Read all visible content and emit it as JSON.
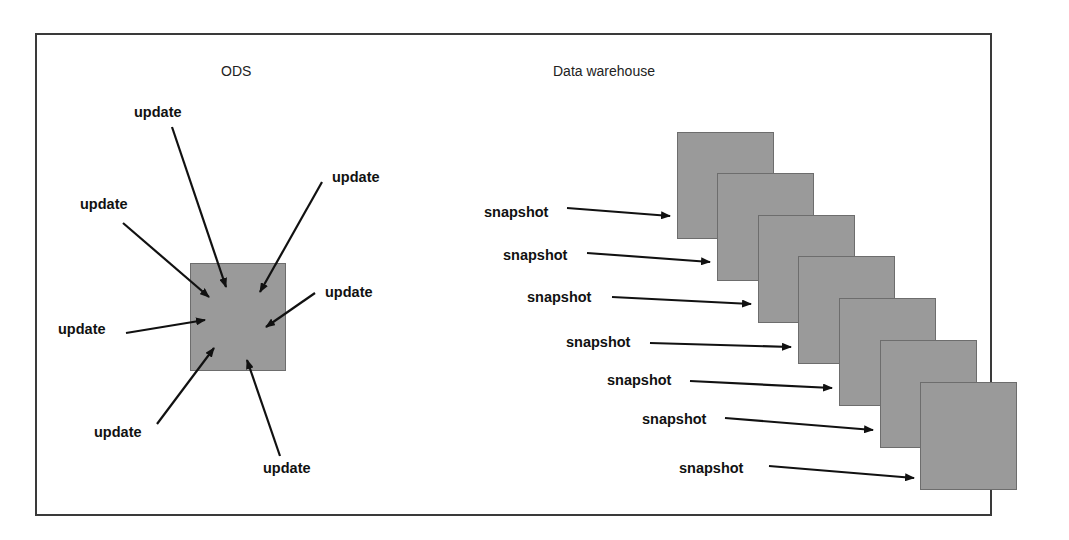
{
  "diagram": {
    "ods": {
      "title": "ODS",
      "update_labels": [
        "update",
        "update",
        "update",
        "update",
        "update",
        "update",
        "update"
      ],
      "box_color": "#9a9a9a"
    },
    "warehouse": {
      "title": "Data warehouse",
      "snapshot_labels": [
        "snapshot",
        "snapshot",
        "snapshot",
        "snapshot",
        "snapshot",
        "snapshot",
        "snapshot"
      ],
      "box_count": 7,
      "box_color": "#9a9a9a"
    },
    "arrow_color": "#111111",
    "frame_color": "#3a3a3a"
  }
}
